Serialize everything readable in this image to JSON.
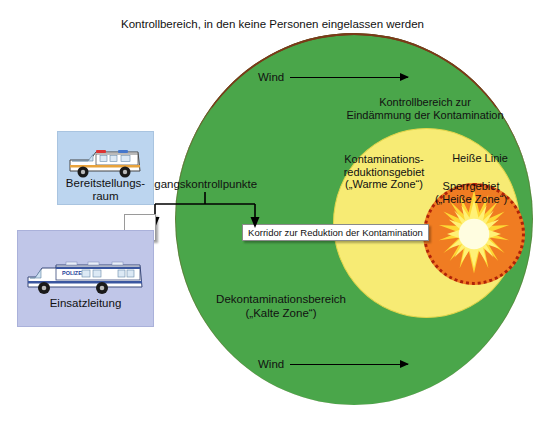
{
  "diagram": {
    "title": "Kontrollbereich, in den keine Personen eingelassen werden",
    "zones": {
      "outer_green": {
        "label": "Dekontaminationsbereich\n(„Kalte Zone“)",
        "label_line1": "Dekontaminationsbereich",
        "label_line2": "(„Kalte Zone“)",
        "color": "#4aa64a"
      },
      "containment": {
        "label_line1": "Kontrollbereich zur",
        "label_line2": "Eindämmung der Kontamination"
      },
      "warm_yellow": {
        "label_line1": "Kontaminations-",
        "label_line2": "reduktionsgebiet",
        "label_line3": "(„Warme Zone“)",
        "color": "#f7eb74"
      },
      "hot_red": {
        "hot_line_label": "Heiße Linie",
        "label_line1": "Sperrgebiet",
        "label_line2": "(„Heiße Zone“)",
        "color": "#f07c22",
        "border_color": "#b02208"
      }
    },
    "corridor": {
      "label": "Korridor zur Reduktion der Kontamination"
    },
    "access_control": {
      "label": "Zugangskontrollpunkte"
    },
    "wind": {
      "top_label": "Wind",
      "bottom_label": "Wind"
    },
    "facilities": [
      {
        "name": "bereitstellungsraum",
        "label_line1": "Bereitstellungs-",
        "label_line2": "raum",
        "vehicle": "ambulance",
        "box_color": "#bcd5ef"
      },
      {
        "name": "einsatzleitung",
        "label_line1": "Einsatzleitung",
        "label_line2": "",
        "vehicle": "police-command-truck",
        "box_color": "#c0c6e8"
      }
    ]
  }
}
